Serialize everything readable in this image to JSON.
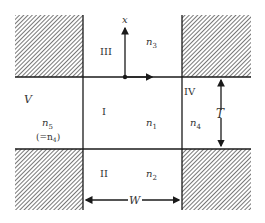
{
  "diagram": {
    "type": "waveguide-cross-section",
    "regions": [
      {
        "id": "I",
        "label": "I",
        "index": "n",
        "sub": "1"
      },
      {
        "id": "II",
        "label": "II",
        "index": "n",
        "sub": "2"
      },
      {
        "id": "III",
        "label": "III",
        "index": "n",
        "sub": "3"
      },
      {
        "id": "IV",
        "label": "IV",
        "index": "n",
        "sub": "4"
      },
      {
        "id": "V",
        "label": "V",
        "index": "n",
        "sub": "5",
        "note_prefix": "(=n",
        "note_sub": "4",
        "note_suffix": ")"
      }
    ],
    "axis": {
      "label": "x"
    },
    "dimensions": {
      "width_label": "W",
      "thickness_label": "T"
    },
    "colors": {
      "line": "#1a1a1a",
      "hatch": "#555555",
      "text": "#333333"
    }
  }
}
